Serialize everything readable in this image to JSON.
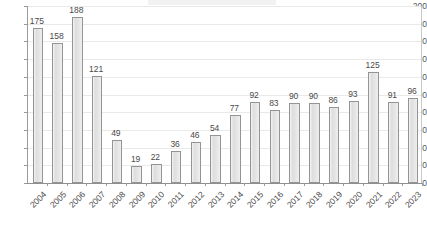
{
  "chart_data": {
    "type": "bar",
    "title": "",
    "subtitle": "",
    "xlabel": "",
    "ylabel": "",
    "categories": [
      "2004",
      "2005",
      "2006",
      "2007",
      "2008",
      "2009",
      "2010",
      "2011",
      "2012",
      "2013",
      "2014",
      "2015",
      "2016",
      "2017",
      "2018",
      "2019",
      "2020",
      "2021",
      "2022",
      "2023"
    ],
    "values": [
      175,
      158,
      188,
      121,
      49,
      19,
      22,
      36,
      46,
      54,
      77,
      92,
      83,
      90,
      90,
      86,
      93,
      125,
      91,
      96
    ],
    "series": [
      {
        "name": "",
        "values": [
          175,
          158,
          188,
          121,
          49,
          19,
          22,
          36,
          46,
          54,
          77,
          92,
          83,
          90,
          90,
          86,
          93,
          125,
          91,
          96
        ]
      }
    ],
    "ylim": [
      0,
      200
    ],
    "ytick_values": [
      0,
      20,
      40,
      60,
      80,
      100,
      120,
      140,
      160,
      180,
      200
    ],
    "ytick_labels": [
      "0",
      "20",
      "40",
      "60",
      "80",
      "100",
      "120",
      "140",
      "160",
      "180",
      "200"
    ],
    "data_labels": [
      "175",
      "158",
      "188",
      "121",
      "49",
      "19",
      "22",
      "36",
      "46",
      "54",
      "77",
      "92",
      "83",
      "90",
      "90",
      "86",
      "93",
      "125",
      "91",
      "96"
    ],
    "grid": true,
    "grid_axis": "y",
    "legend": false,
    "legend_position": "none",
    "xtick_rotation": -45,
    "colors": {
      "bar_fill": "#e4e4e4",
      "bar_border": "#949494",
      "gridline": "#e9e9e9",
      "axis": "#8f8f8f",
      "label_text": "#4a4a4a",
      "background": "#ffffff"
    }
  }
}
